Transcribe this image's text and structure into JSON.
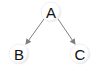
{
  "diagram": {
    "type": "tree",
    "nodes": [
      {
        "id": "A",
        "label": "A",
        "x": 51,
        "y": 12
      },
      {
        "id": "B",
        "label": "B",
        "x": 19,
        "y": 54
      },
      {
        "id": "C",
        "label": "C",
        "x": 80,
        "y": 54
      }
    ],
    "edges": [
      {
        "from": "A",
        "to": "B",
        "directed": true
      },
      {
        "from": "A",
        "to": "C",
        "directed": true
      }
    ],
    "colors": {
      "node_fill": "#ffffff",
      "node_shadow": "#d9d9d9",
      "edge": "#7f7f7f",
      "text": "#111111"
    }
  }
}
